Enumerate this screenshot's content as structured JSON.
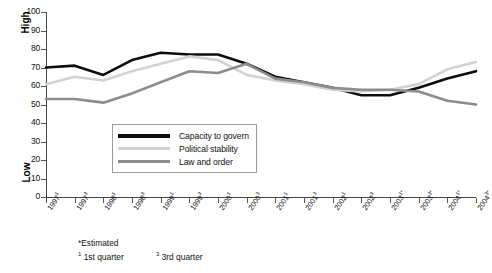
{
  "chart_data": {
    "type": "line",
    "title": "",
    "xlabel": "",
    "ylabel": "",
    "ylim": [
      0,
      100
    ],
    "ytick_step": 10,
    "grid": false,
    "legend_position": "inside lower-left-center",
    "y_axis_high_label": "High",
    "y_axis_low_label": "Low",
    "ytick_labels": [
      "100",
      "90",
      "80",
      "70",
      "60",
      "50",
      "40",
      "30",
      "20",
      "10",
      "0"
    ],
    "categories": [
      "1997¹",
      "1997³",
      "1998¹",
      "1998³",
      "1999¹",
      "1999³",
      "2000¹",
      "2000³",
      "2001¹",
      "2001³",
      "2002¹",
      "2002³",
      "2003¹*",
      "2003³*",
      "2004¹*",
      "2004³*"
    ],
    "categories_parts": [
      {
        "year": "1997",
        "mark": "1"
      },
      {
        "year": "1997",
        "mark": "3"
      },
      {
        "year": "1998",
        "mark": "1"
      },
      {
        "year": "1998",
        "mark": "3"
      },
      {
        "year": "1999",
        "mark": "1"
      },
      {
        "year": "1999",
        "mark": "3"
      },
      {
        "year": "2000",
        "mark": "1"
      },
      {
        "year": "2000",
        "mark": "3"
      },
      {
        "year": "2001",
        "mark": "1"
      },
      {
        "year": "2001",
        "mark": "3"
      },
      {
        "year": "2002",
        "mark": "1"
      },
      {
        "year": "2002",
        "mark": "3"
      },
      {
        "year": "2003",
        "mark": "1*"
      },
      {
        "year": "2003",
        "mark": "3*"
      },
      {
        "year": "2004",
        "mark": "1*"
      },
      {
        "year": "2004",
        "mark": "3*"
      }
    ],
    "series": [
      {
        "name": "Capacity to govern",
        "color": "#0d0d0d",
        "width": 2.6,
        "values": [
          70,
          71,
          66,
          74,
          78,
          77,
          77,
          72,
          65,
          62,
          59,
          55,
          55,
          59,
          64,
          68
        ]
      },
      {
        "name": "Political stability",
        "color": "#d2d2d2",
        "width": 2.6,
        "values": [
          61,
          65,
          63,
          68,
          72,
          76,
          74,
          66,
          63,
          61,
          58,
          57,
          58,
          61,
          69,
          73
        ]
      },
      {
        "name": "Law and order",
        "color": "#8c8c8c",
        "width": 2.6,
        "values": [
          53,
          53,
          51,
          56,
          62,
          68,
          67,
          72,
          64,
          62,
          59,
          58,
          58,
          57,
          52,
          50
        ]
      }
    ]
  },
  "legend": {
    "items": [
      {
        "label": "Capacity to govern",
        "color": "#0d0d0d"
      },
      {
        "label": "Political stability",
        "color": "#d2d2d2"
      },
      {
        "label": "Law and order",
        "color": "#8c8c8c"
      }
    ]
  },
  "footnotes": {
    "estimated": "*Estimated",
    "q1_mark": "1",
    "q1_text": "1st quarter",
    "q3_mark": "3",
    "q3_text": "3rd quarter"
  }
}
